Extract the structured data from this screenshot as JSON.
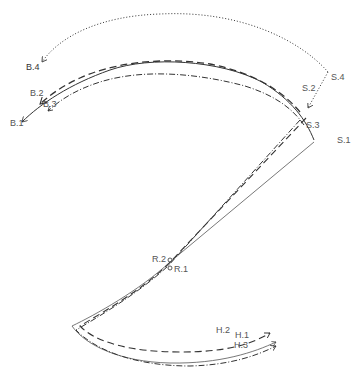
{
  "diagram": {
    "colors": {
      "stroke": "#333333",
      "label": "#555555",
      "background": "#ffffff"
    },
    "line_styles": {
      "1": "solid",
      "2": "dashed",
      "3": "dash-dot",
      "4": "dotted"
    },
    "labels": {
      "B1": "B.1",
      "B2": "B.2",
      "B3": "B.3",
      "B4": "B.4",
      "S1": "S.1",
      "S2": "S.2",
      "S3": "S.3",
      "S4": "S.4",
      "R1": "R.1",
      "R2": "R.2",
      "H1": "H.1",
      "H2": "H.2",
      "H3": "H.3"
    }
  }
}
